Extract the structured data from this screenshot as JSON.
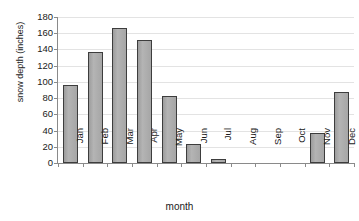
{
  "chart_data": {
    "type": "bar",
    "title": "",
    "xlabel": "month",
    "ylabel": "snow depth (inches)",
    "categories": [
      "Jan",
      "Feb",
      "Mar",
      "Apr",
      "May",
      "Jun",
      "Jul",
      "Aug",
      "Sep",
      "Oct",
      "Nov",
      "Dec"
    ],
    "values": [
      96,
      137,
      166,
      152,
      83,
      23,
      5,
      0,
      0,
      0,
      37,
      87
    ],
    "series": [
      {
        "name": "snow depth",
        "values": [
          96,
          137,
          166,
          152,
          83,
          23,
          5,
          0,
          0,
          0,
          37,
          87
        ]
      }
    ],
    "ylim": [
      0,
      180
    ],
    "ytick_values": [
      0,
      20,
      40,
      60,
      80,
      100,
      120,
      140,
      160,
      180
    ],
    "ytick_labels": [
      "0",
      "20",
      "40",
      "60",
      "80",
      "100",
      "120",
      "140",
      "160",
      "180"
    ],
    "grid": true,
    "legend": false,
    "legend_position": "none",
    "bar_color": "#a9a9a9",
    "bar_border_color": "#3d3d3d",
    "gridline_color": "#e3e3e3",
    "axis_color": "#8a8a8a",
    "background": "#ffffff"
  }
}
